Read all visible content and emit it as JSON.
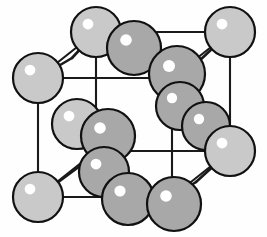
{
  "figure": {
    "background_color": "#fefefe",
    "width": 267,
    "height": 237
  },
  "style": {
    "atom_light_fill": "#c9c9c9",
    "atom_dark_fill": "#a8a8a8",
    "atom_outline_color": "#111111",
    "atom_outline_width": 2.2,
    "highlight_color": "#ffffff",
    "cell_edge_color": "#1a1a1a",
    "cell_edge_width": 2.1,
    "bond_color": "#1a1a1a",
    "bond_width": 2.6
  },
  "cube": {
    "description": "Cubic cell frame drawn in oblique projection",
    "vertices": {
      "front_top_left": [
        38,
        78
      ],
      "front_top_right": [
        172,
        78
      ],
      "front_bottom_left": [
        38,
        197
      ],
      "front_bottom_right": [
        172,
        197
      ],
      "back_top_left": [
        96,
        32
      ],
      "back_top_right": [
        230,
        32
      ],
      "back_bottom_left": [
        96,
        151
      ],
      "back_bottom_right": [
        230,
        151
      ]
    },
    "edges": [
      [
        "front_top_left",
        "front_top_right"
      ],
      [
        "front_top_right",
        "front_bottom_right"
      ],
      [
        "front_bottom_right",
        "front_bottom_left"
      ],
      [
        "front_bottom_left",
        "front_top_left"
      ],
      [
        "back_top_left",
        "back_top_right"
      ],
      [
        "back_top_right",
        "back_bottom_right"
      ],
      [
        "back_bottom_right",
        "back_bottom_left"
      ],
      [
        "back_bottom_left",
        "back_top_left"
      ],
      [
        "front_top_left",
        "back_top_left"
      ],
      [
        "front_top_right",
        "back_top_right"
      ],
      [
        "front_bottom_right",
        "back_bottom_right"
      ],
      [
        "front_bottom_left",
        "back_bottom_left"
      ]
    ]
  },
  "bonds": [
    {
      "name": "bond-back-top-left-to-interior",
      "from": [
        96,
        32
      ],
      "to": [
        72,
        58
      ]
    },
    {
      "name": "bond-front-top-left-to-interior",
      "from": [
        38,
        78
      ],
      "to": [
        72,
        58
      ]
    },
    {
      "name": "bond-back-top-right-to-interior",
      "from": [
        230,
        32
      ],
      "to": [
        198,
        62
      ]
    },
    {
      "name": "bond-interior-upper-right-to-cube",
      "from": [
        198,
        62
      ],
      "to": [
        172,
        78
      ]
    },
    {
      "name": "bond-front-bottom-left-to-interior",
      "from": [
        38,
        197
      ],
      "to": [
        80,
        166
      ]
    },
    {
      "name": "bond-interior-lower-left-down",
      "from": [
        80,
        166
      ],
      "to": [
        96,
        151
      ]
    },
    {
      "name": "bond-back-bottom-right-to-interior",
      "from": [
        230,
        151
      ],
      "to": [
        196,
        182
      ]
    },
    {
      "name": "bond-interior-lower-right-to-cube",
      "from": [
        196,
        182
      ],
      "to": [
        172,
        197
      ]
    }
  ],
  "atoms": [
    {
      "id": 1,
      "name": "corner-back-top-left",
      "cx": 96,
      "cy": 32,
      "r": 25,
      "shade": "light",
      "highlight": [
        -8,
        -8
      ]
    },
    {
      "id": 2,
      "name": "face-top-rear",
      "cx": 134,
      "cy": 48,
      "r": 27,
      "shade": "dark",
      "highlight": [
        -8,
        -8
      ]
    },
    {
      "id": 3,
      "name": "corner-back-top-right",
      "cx": 230,
      "cy": 32,
      "r": 25,
      "shade": "light",
      "highlight": [
        -8,
        -8
      ]
    },
    {
      "id": 4,
      "name": "corner-front-top-left",
      "cx": 38,
      "cy": 78,
      "r": 25,
      "shade": "light",
      "highlight": [
        -8,
        -8
      ]
    },
    {
      "id": 5,
      "name": "face-top-right",
      "cx": 177,
      "cy": 74,
      "r": 28,
      "shade": "dark",
      "highlight": [
        -8,
        -8
      ]
    },
    {
      "id": 6,
      "name": "interior-right-upper",
      "cx": 180,
      "cy": 106,
      "r": 24,
      "shade": "dark",
      "highlight": [
        -8,
        -8
      ]
    },
    {
      "id": 7,
      "name": "face-right-middle",
      "cx": 206,
      "cy": 126,
      "r": 24,
      "shade": "dark",
      "highlight": [
        -7,
        -7
      ]
    },
    {
      "id": 8,
      "name": "interior-left-rear",
      "cx": 77,
      "cy": 124,
      "r": 25,
      "shade": "light",
      "highlight": [
        -8,
        -8
      ]
    },
    {
      "id": 9,
      "name": "interior-center-upper",
      "cx": 108,
      "cy": 136,
      "r": 27,
      "shade": "dark",
      "highlight": [
        -8,
        -8
      ]
    },
    {
      "id": 10,
      "name": "interior-center-lower",
      "cx": 104,
      "cy": 172,
      "r": 25,
      "shade": "dark",
      "highlight": [
        -8,
        -8
      ]
    },
    {
      "id": 11,
      "name": "corner-front-bottom-right",
      "cx": 230,
      "cy": 151,
      "r": 25,
      "shade": "light",
      "highlight": [
        -8,
        -8
      ]
    },
    {
      "id": 12,
      "name": "corner-front-bottom-left",
      "cx": 38,
      "cy": 197,
      "r": 25,
      "shade": "light",
      "highlight": [
        -8,
        -8
      ]
    },
    {
      "id": 13,
      "name": "face-bottom-left",
      "cx": 128,
      "cy": 199,
      "r": 26,
      "shade": "dark",
      "highlight": [
        -8,
        -8
      ]
    },
    {
      "id": 14,
      "name": "face-bottom-right",
      "cx": 174,
      "cy": 204,
      "r": 27,
      "shade": "dark",
      "highlight": [
        -8,
        -8
      ]
    }
  ]
}
